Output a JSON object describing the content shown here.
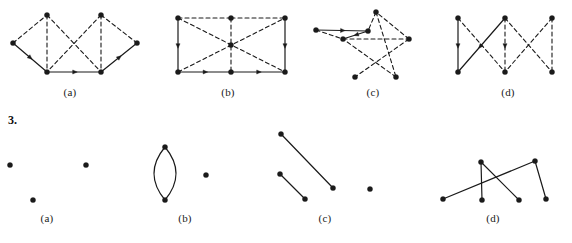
{
  "page": {
    "background_color": "#ffffff",
    "ink_color": "#1a1a1a",
    "width": 572,
    "height": 243
  },
  "item_number": {
    "text": "3.",
    "x": 8,
    "y": 113
  },
  "rows": [
    {
      "name": "row-top-directed-multigraphs",
      "label_y": 86,
      "figures": [
        {
          "key": "top-a",
          "label": "(a)",
          "label_x": 70,
          "vertices": [
            {
              "id": "L",
              "x": 13,
              "y": 43
            },
            {
              "id": "T1",
              "x": 47,
              "y": 15
            },
            {
              "id": "B1",
              "x": 47,
              "y": 72
            },
            {
              "id": "T2",
              "x": 101,
              "y": 15
            },
            {
              "id": "B2",
              "x": 101,
              "y": 72
            },
            {
              "id": "R",
              "x": 137,
              "y": 43
            }
          ],
          "edges": [
            {
              "from": "L",
              "to": "T1",
              "style": "dashed",
              "arrow": "none"
            },
            {
              "from": "L",
              "to": "B1",
              "style": "solid",
              "arrow": "mid"
            },
            {
              "from": "T1",
              "to": "B1",
              "style": "dashed",
              "arrow": "none"
            },
            {
              "from": "T1",
              "to": "B2",
              "style": "dashed",
              "arrow": "none"
            },
            {
              "from": "T2",
              "to": "B1",
              "style": "dashed",
              "arrow": "none"
            },
            {
              "from": "T2",
              "to": "B2",
              "style": "dashed",
              "arrow": "none"
            },
            {
              "from": "B1",
              "to": "B2",
              "style": "solid",
              "arrow": "mid"
            },
            {
              "from": "B2",
              "to": "R",
              "style": "solid",
              "arrow": "mid"
            },
            {
              "from": "T2",
              "to": "R",
              "style": "dashed",
              "arrow": "none"
            }
          ]
        },
        {
          "key": "top-b",
          "label": "(b)",
          "label_x": 228,
          "vertices": [
            {
              "id": "TL",
              "x": 178,
              "y": 18
            },
            {
              "id": "TM",
              "x": 231,
              "y": 18
            },
            {
              "id": "TR",
              "x": 285,
              "y": 18
            },
            {
              "id": "BL",
              "x": 178,
              "y": 72
            },
            {
              "id": "BM",
              "x": 231,
              "y": 72
            },
            {
              "id": "BR",
              "x": 285,
              "y": 72
            },
            {
              "id": "C",
              "x": 231,
              "y": 45
            }
          ],
          "edges": [
            {
              "from": "TL",
              "to": "TM",
              "style": "dashed",
              "arrow": "none"
            },
            {
              "from": "TM",
              "to": "TR",
              "style": "dashed",
              "arrow": "none"
            },
            {
              "from": "TL",
              "to": "BL",
              "style": "solid",
              "arrow": "mid"
            },
            {
              "from": "TR",
              "to": "BR",
              "style": "solid",
              "arrow": "mid"
            },
            {
              "from": "BL",
              "to": "BM",
              "style": "solid",
              "arrow": "mid"
            },
            {
              "from": "BM",
              "to": "BR",
              "style": "solid",
              "arrow": "mid"
            },
            {
              "from": "TM",
              "to": "BM",
              "style": "dashed",
              "arrow": "none"
            },
            {
              "from": "TL",
              "to": "BR",
              "style": "dashed",
              "arrow": "none"
            },
            {
              "from": "BL",
              "to": "TR",
              "style": "dashed",
              "arrow": "none"
            }
          ]
        },
        {
          "key": "top-c",
          "label": "(c)",
          "label_x": 373,
          "vertices": [
            {
              "id": "P0",
              "x": 376,
              "y": 12
            },
            {
              "id": "P1",
              "x": 409,
              "y": 39
            },
            {
              "id": "P2",
              "x": 396,
              "y": 77
            },
            {
              "id": "P3",
              "x": 355,
              "y": 77
            },
            {
              "id": "P4",
              "x": 343,
              "y": 39
            },
            {
              "id": "A",
              "x": 316,
              "y": 30
            },
            {
              "id": "B",
              "x": 368,
              "y": 31
            }
          ],
          "edges": [
            {
              "from": "A",
              "to": "B",
              "style": "solid",
              "arrow": "mid"
            },
            {
              "from": "P0",
              "to": "B",
              "style": "dashed",
              "arrow": "none"
            },
            {
              "from": "B",
              "to": "P4",
              "style": "solid",
              "arrow": "mid"
            },
            {
              "from": "A",
              "to": "P4",
              "style": "dashed",
              "arrow": "none"
            },
            {
              "from": "P0",
              "to": "P2",
              "style": "dashed",
              "arrow": "none"
            },
            {
              "from": "P1",
              "to": "P3",
              "style": "dashed",
              "arrow": "none"
            },
            {
              "from": "P2",
              "to": "P4",
              "style": "dashed",
              "arrow": "none"
            },
            {
              "from": "P4",
              "to": "P1",
              "style": "dashed",
              "arrow": "none"
            },
            {
              "from": "P1",
              "to": "P0",
              "style": "dashed",
              "arrow": "none"
            }
          ]
        },
        {
          "key": "top-d",
          "label": "(d)",
          "label_x": 508,
          "vertices": [
            {
              "id": "T1",
              "x": 458,
              "y": 18
            },
            {
              "id": "B1",
              "x": 458,
              "y": 72
            },
            {
              "id": "T2",
              "x": 505,
              "y": 18
            },
            {
              "id": "B2",
              "x": 505,
              "y": 72
            },
            {
              "id": "T3",
              "x": 552,
              "y": 18
            },
            {
              "id": "B3",
              "x": 552,
              "y": 72
            }
          ],
          "edges": [
            {
              "from": "T1",
              "to": "B1",
              "style": "solid",
              "arrow": "mid"
            },
            {
              "from": "T1",
              "to": "B2",
              "style": "dashed",
              "arrow": "none"
            },
            {
              "from": "T2",
              "to": "B1",
              "style": "solid",
              "arrow": "mid"
            },
            {
              "from": "T2",
              "to": "B2",
              "style": "dashed",
              "arrow": "mid"
            },
            {
              "from": "T2",
              "to": "B3",
              "style": "dashed",
              "arrow": "none"
            },
            {
              "from": "T3",
              "to": "B2",
              "style": "dashed",
              "arrow": "none"
            },
            {
              "from": "T3",
              "to": "B3",
              "style": "dashed",
              "arrow": "none"
            }
          ]
        }
      ]
    },
    {
      "name": "row-bottom-simple-graphs",
      "label_y": 212,
      "figures": [
        {
          "key": "bot-a",
          "label": "(a)",
          "label_x": 47,
          "vertices": [
            {
              "id": "V1",
              "x": 10,
              "y": 165
            },
            {
              "id": "V2",
              "x": 86,
              "y": 165
            },
            {
              "id": "V3",
              "x": 33,
              "y": 200
            }
          ],
          "edges": []
        },
        {
          "key": "bot-b",
          "label": "(b)",
          "label_x": 185,
          "vertices": [
            {
              "id": "U",
              "x": 165,
              "y": 147
            },
            {
              "id": "W",
              "x": 165,
              "y": 200
            },
            {
              "id": "X",
              "x": 206,
              "y": 175
            }
          ],
          "edges": [
            {
              "from": "U",
              "to": "W",
              "style": "solid",
              "arrow": "none",
              "curve": -11
            },
            {
              "from": "U",
              "to": "W",
              "style": "solid",
              "arrow": "none",
              "curve": 11
            }
          ]
        },
        {
          "key": "bot-c",
          "label": "(c)",
          "label_x": 325,
          "vertices": [
            {
              "id": "C1",
              "x": 281,
              "y": 134
            },
            {
              "id": "C2",
              "x": 333,
              "y": 188
            },
            {
              "id": "C3",
              "x": 280,
              "y": 174
            },
            {
              "id": "C4",
              "x": 305,
              "y": 199
            },
            {
              "id": "C5",
              "x": 370,
              "y": 189
            }
          ],
          "edges": [
            {
              "from": "C1",
              "to": "C2",
              "style": "solid",
              "arrow": "none"
            },
            {
              "from": "C3",
              "to": "C4",
              "style": "solid",
              "arrow": "none"
            }
          ]
        },
        {
          "key": "bot-d",
          "label": "(d)",
          "label_x": 493,
          "vertices": [
            {
              "id": "D1",
              "x": 443,
              "y": 199
            },
            {
              "id": "D2",
              "x": 481,
              "y": 162
            },
            {
              "id": "D3",
              "x": 482,
              "y": 200
            },
            {
              "id": "D4",
              "x": 519,
              "y": 200
            },
            {
              "id": "D5",
              "x": 535,
              "y": 161
            },
            {
              "id": "D6",
              "x": 546,
              "y": 199
            }
          ],
          "edges": [
            {
              "from": "D1",
              "to": "D5",
              "style": "solid",
              "arrow": "none"
            },
            {
              "from": "D2",
              "to": "D3",
              "style": "solid",
              "arrow": "none"
            },
            {
              "from": "D2",
              "to": "D4",
              "style": "solid",
              "arrow": "none"
            },
            {
              "from": "D5",
              "to": "D6",
              "style": "solid",
              "arrow": "none"
            }
          ]
        }
      ]
    }
  ],
  "style_tokens": {
    "vertex_radius": 2.6,
    "solid_stroke_width": 1.2,
    "dashed_stroke_width": 1.1,
    "dash_pattern": "4,3",
    "arrow_size": 5
  }
}
